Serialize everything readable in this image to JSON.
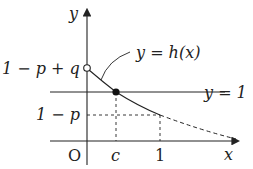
{
  "diagram": {
    "type": "function-graph",
    "axes": {
      "x_label": "x",
      "y_label": "y",
      "origin_label": "O"
    },
    "x_ticks": [
      {
        "label": "c"
      },
      {
        "label": "1"
      }
    ],
    "y_ticks": [
      {
        "label": "1 − p + q",
        "marker": "open-circle"
      },
      {
        "label": "1 − p",
        "style": "dashed"
      }
    ],
    "lines": [
      {
        "label": "y = 1",
        "style": "solid",
        "orientation": "horizontal"
      }
    ],
    "curve": {
      "label": "y = h(x)",
      "start_point": "open circle at (0, 1 − p + q)",
      "marked_point": "filled dot at (c, 1)",
      "end_solid": "(1, 1 − p)",
      "continuation": "dashed beyond x = 1"
    },
    "colors": {
      "ink": "#222222",
      "background": "#ffffff"
    }
  }
}
